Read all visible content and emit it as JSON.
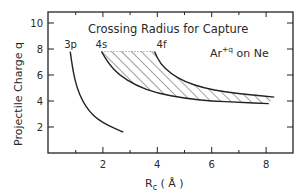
{
  "chart_data": {
    "type": "line",
    "title": "Crossing Radius for Capture",
    "annotation": "Ar+q on Ne",
    "annotation_parts": {
      "base": "Ar",
      "sup": "+q",
      "rest": " on Ne"
    },
    "xlabel": "Rc (Å)",
    "xlabel_parts": {
      "base": "R",
      "sub": "c",
      "unit": " ( Å )"
    },
    "ylabel": "Projectile Charge q",
    "xlim": [
      0,
      9
    ],
    "ylim": [
      0,
      11
    ],
    "xticks": [
      2,
      4,
      6,
      8
    ],
    "xminor": [
      1,
      3,
      5,
      7
    ],
    "yticks": [
      2,
      4,
      6,
      8,
      10
    ],
    "grid": false,
    "series": [
      {
        "name": "3p",
        "x": [
          0.8,
          0.9,
          1.05,
          1.25,
          1.5,
          1.8,
          2.2,
          2.75
        ],
        "y": [
          7.8,
          6.3,
          5.0,
          4.0,
          3.2,
          2.6,
          2.1,
          1.6
        ]
      },
      {
        "name": "4s",
        "x": [
          1.95,
          2.2,
          2.6,
          3.2,
          4.0,
          5.0,
          6.0,
          7.0,
          8.1
        ],
        "y": [
          7.8,
          6.9,
          6.0,
          5.2,
          4.6,
          4.2,
          4.0,
          3.9,
          3.8
        ]
      },
      {
        "name": "4f",
        "x": [
          3.9,
          4.1,
          4.5,
          5.0,
          5.7,
          6.5,
          7.3,
          8.3
        ],
        "y": [
          7.8,
          6.9,
          6.1,
          5.5,
          5.0,
          4.7,
          4.5,
          4.3
        ]
      }
    ],
    "shaded_region": {
      "between": [
        "4s",
        "4f"
      ],
      "style": "hatched",
      "top_q": 7.8
    }
  }
}
